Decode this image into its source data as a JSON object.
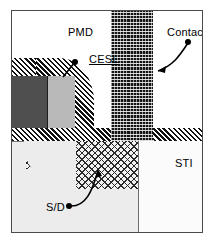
{
  "figure": {
    "type": "semiconductor-cross-section",
    "title": "",
    "border_color": "#4a4a4a",
    "background": "#ffffff"
  },
  "labels": {
    "pmd": "PMD",
    "cesl": "CESL",
    "contact": "Contact",
    "sti": "STI",
    "sd": "S/D"
  },
  "regions": [
    {
      "name": "PMD",
      "label": "PMD",
      "fill": "white",
      "description": "Pre-metal dielectric, plain white upper field",
      "color": "#ffffff"
    },
    {
      "name": "CESL",
      "label": "CESL",
      "fill": "diagonal-hatch",
      "description": "Contact etch stop layer, dense 45 degree black and white diagonal stripes draping over the gate stack and running horizontally across the wafer surface",
      "color": "#111111",
      "underlined": true
    },
    {
      "name": "Contact",
      "label": "Contact",
      "fill": "dark-dotted",
      "description": "Vertical dark woven/dotted plug column extending from the top of the frame down through the CESL band to the S/D region",
      "color": "#141414"
    },
    {
      "name": "S/D",
      "label": "S/D",
      "fill": "cross-hatch",
      "description": "Source/drain diffusion, diamond mesh cross-hatch with a rounded left boundary",
      "color": "#2a2a2a"
    },
    {
      "name": "STI",
      "label": "STI",
      "fill": "near-white",
      "description": "Shallow trench isolation block at lower right",
      "color": "#fbfbfb"
    },
    {
      "name": "Gate electrode",
      "label": "",
      "fill": "dark-gray",
      "description": "Dark gray gate block under the CESL cap",
      "color": "#4f4f4f"
    },
    {
      "name": "Gate spacer",
      "label": "",
      "fill": "light-gray",
      "description": "Light gray block adjacent to the gate electrode",
      "color": "#b9b9b9"
    },
    {
      "name": "Substrate",
      "label": "",
      "fill": "light-gray",
      "description": "Light gray silicon substrate in the lower left",
      "color": "#ececec"
    }
  ],
  "callouts": [
    {
      "label": "CESL",
      "marker": "dot",
      "points_to": "CESL diagonal hatch cap over gate"
    },
    {
      "label": "Contact",
      "marker": "dot",
      "points_to": "dark vertical contact plug column"
    },
    {
      "label": "S/D",
      "marker": "dot",
      "points_to": "cross-hatched source/drain region"
    }
  ]
}
